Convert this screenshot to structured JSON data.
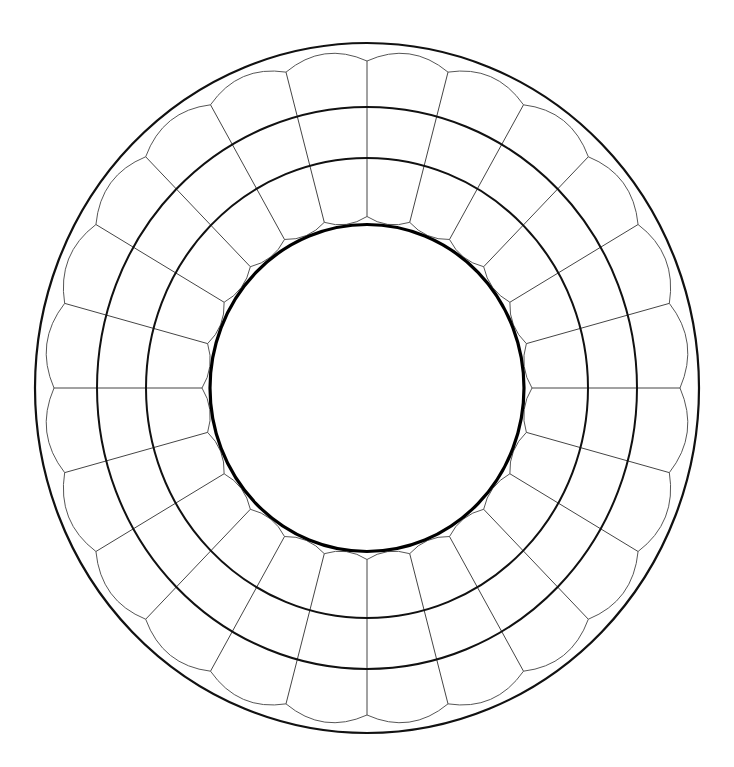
{
  "diagram": {
    "title": "",
    "type": "concentric-ring-segmented-diagram",
    "canvas": {
      "width": 734,
      "height": 767,
      "background": "#ffffff"
    },
    "center": {
      "x": 367,
      "y": 388
    },
    "aspect_y_over_x": 1.04,
    "spoke_count": 24,
    "spoke_start_angle_deg": 0,
    "rings": [
      {
        "name": "outer-boundary",
        "rx": 332,
        "ry": 345,
        "stroke": "#111111",
        "width": 2.2
      },
      {
        "name": "middle-ring-outer",
        "rx": 270,
        "ry": 281,
        "stroke": "#111111",
        "width": 2
      },
      {
        "name": "middle-ring-inner",
        "rx": 221,
        "ry": 230,
        "stroke": "#111111",
        "width": 2
      },
      {
        "name": "inner-thick-circle",
        "rx": 157,
        "ry": 163.5,
        "stroke": "#000000",
        "width": 3.2
      }
    ],
    "outer_scallop": {
      "cusp_rx": 313,
      "cusp_ry": 327,
      "bulge_rx": 323,
      "bulge_ry": 337,
      "stroke": "#555555",
      "width": 1
    },
    "inner_scallop": {
      "cusp_rx": 165,
      "cusp_ry": 171.5,
      "bulge_rx": 158.5,
      "bulge_ry": 165,
      "stroke": "#555555",
      "width": 1
    },
    "spokes": {
      "stroke": "#444444",
      "width": 1
    },
    "labels": []
  }
}
